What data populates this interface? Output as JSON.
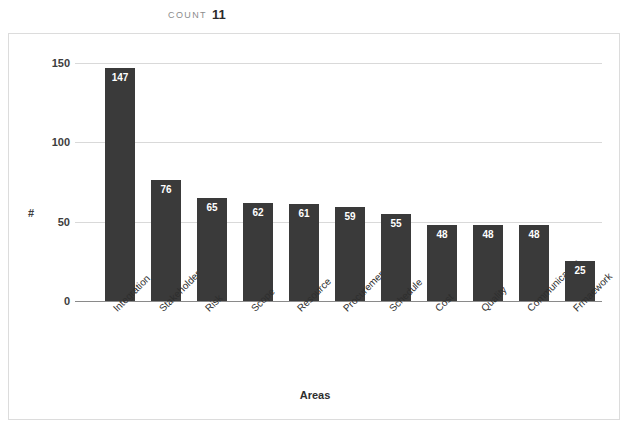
{
  "header": {
    "count_label": "COUNT",
    "count_value": "11"
  },
  "chart_data": {
    "type": "bar",
    "title": "",
    "xlabel": "Areas",
    "ylabel": "#",
    "categories": [
      "Integration",
      "Stakeholder",
      "Risk",
      "Scope",
      "Resource",
      "Procurement",
      "Schedule",
      "Cost",
      "Quality",
      "Communication",
      "Frmaework"
    ],
    "values": [
      147,
      76,
      65,
      62,
      61,
      59,
      55,
      48,
      48,
      48,
      25
    ],
    "ylim": [
      0,
      150
    ],
    "yticks": [
      0,
      50,
      100,
      150
    ],
    "ytick_labels": [
      "0",
      "50",
      "100",
      "150"
    ],
    "grid": true,
    "legend": false,
    "bar_color": "#3a3a3a",
    "value_label_color": "#ffffff",
    "gridline_color": "#d9d9d9",
    "axis_color": "#8a8a8a",
    "label_rotation": "-45"
  }
}
